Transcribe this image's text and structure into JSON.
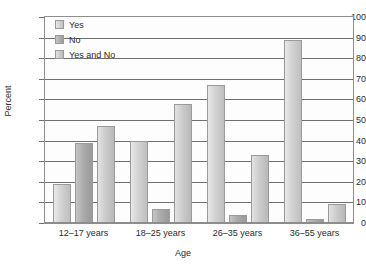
{
  "chart_data": {
    "type": "bar",
    "title": "",
    "xlabel": "Age",
    "ylabel": "Percent",
    "ylim": [
      0,
      100
    ],
    "ytick_step": 10,
    "yticks": [
      0,
      10,
      20,
      30,
      40,
      50,
      60,
      70,
      80,
      90,
      100
    ],
    "ytick_labels": [
      "0",
      "10",
      "20",
      "30",
      "40",
      "50",
      "60",
      "70",
      "80",
      "90",
      "100"
    ],
    "grid": true,
    "grid_axis": "y",
    "legend_position": "top-left",
    "categories": [
      "12–17 years",
      "18–25 years",
      "26–35 years",
      "36–55 years"
    ],
    "series": [
      {
        "name": "Yes",
        "color": "#d2d2d2",
        "values": [
          19,
          40,
          67,
          89
        ]
      },
      {
        "name": "No",
        "color": "#ababab",
        "values": [
          39,
          7,
          4,
          2
        ]
      },
      {
        "name": "Yes and No",
        "color": "#cccccc",
        "values": [
          47,
          58,
          33,
          9
        ]
      }
    ]
  }
}
